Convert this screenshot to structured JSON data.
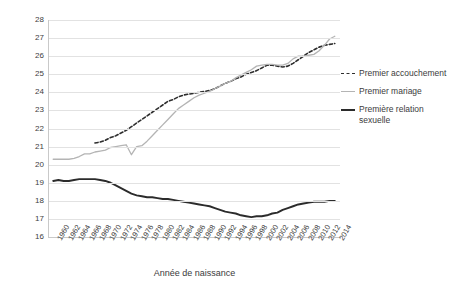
{
  "chart_data": {
    "type": "line",
    "title": "",
    "xlabel": "Année de naissance",
    "ylabel": "",
    "xlim": [
      1959,
      2015
    ],
    "ylim": [
      16,
      28
    ],
    "grid": true,
    "legend_position": "right",
    "x_tick_labels": [
      "1960",
      "1962",
      "1964",
      "1966",
      "1968",
      "1970",
      "1972",
      "1974",
      "1976",
      "1978",
      "1980",
      "1982",
      "1984",
      "1986",
      "1988",
      "1990",
      "1992",
      "1994",
      "1996",
      "1998",
      "2000",
      "2002",
      "2004",
      "2006",
      "2008",
      "2010",
      "2012",
      "2014"
    ],
    "y_tick_labels": [
      "16",
      "17",
      "18",
      "19",
      "20",
      "21",
      "22",
      "23",
      "24",
      "25",
      "26",
      "27",
      "28"
    ],
    "series": [
      {
        "name": "Premier accouchement",
        "style": "dashed",
        "color": "#2e2e2e",
        "x": [
          1968,
          1969,
          1970,
          1971,
          1972,
          1973,
          1974,
          1975,
          1976,
          1977,
          1978,
          1979,
          1980,
          1981,
          1982,
          1983,
          1984,
          1985,
          1986,
          1987,
          1988,
          1989,
          1990,
          1991,
          1992,
          1993,
          1994,
          1995,
          1996,
          1997,
          1998,
          1999,
          2000,
          2001,
          2002,
          2003,
          2004,
          2005,
          2006,
          2007,
          2008,
          2009,
          2010,
          2011,
          2012,
          2013,
          2014
        ],
        "values": [
          21.2,
          21.25,
          21.35,
          21.5,
          21.6,
          21.75,
          21.9,
          22.1,
          22.3,
          22.5,
          22.7,
          22.9,
          23.1,
          23.3,
          23.5,
          23.6,
          23.75,
          23.85,
          23.9,
          23.95,
          24.0,
          24.05,
          24.1,
          24.2,
          24.35,
          24.5,
          24.6,
          24.75,
          24.85,
          25.0,
          25.1,
          25.2,
          25.35,
          25.5,
          25.5,
          25.45,
          25.4,
          25.45,
          25.6,
          25.8,
          26.0,
          26.2,
          26.35,
          26.5,
          26.6,
          26.65,
          26.7
        ]
      },
      {
        "name": "Premier mariage",
        "style": "solid-light",
        "color": "#b4b4b4",
        "x": [
          1960,
          1961,
          1962,
          1963,
          1964,
          1965,
          1966,
          1967,
          1968,
          1969,
          1970,
          1971,
          1972,
          1973,
          1974,
          1975,
          1976,
          1977,
          1978,
          1979,
          1980,
          1981,
          1982,
          1983,
          1984,
          1985,
          1986,
          1987,
          1988,
          1989,
          1990,
          1991,
          1992,
          1993,
          1994,
          1995,
          1996,
          1997,
          1998,
          1999,
          2000,
          2001,
          2002,
          2003,
          2004,
          2005,
          2006,
          2007,
          2008,
          2009,
          2010,
          2011,
          2012,
          2013,
          2014
        ],
        "values": [
          20.3,
          20.3,
          20.3,
          20.3,
          20.35,
          20.45,
          20.6,
          20.6,
          20.7,
          20.75,
          20.8,
          20.95,
          21.0,
          21.05,
          21.1,
          20.55,
          21.0,
          21.05,
          21.3,
          21.6,
          21.9,
          22.2,
          22.5,
          22.8,
          23.1,
          23.3,
          23.5,
          23.7,
          23.85,
          23.95,
          24.05,
          24.2,
          24.35,
          24.5,
          24.6,
          24.8,
          24.95,
          25.1,
          25.25,
          25.45,
          25.5,
          25.55,
          25.55,
          25.5,
          25.5,
          25.6,
          25.85,
          26.0,
          26.0,
          26.05,
          26.1,
          26.3,
          26.6,
          26.95,
          27.1
        ]
      },
      {
        "name": "Première relation sexuelle",
        "style": "solid-bold",
        "color": "#2b2b2b",
        "x": [
          1960,
          1961,
          1962,
          1963,
          1964,
          1965,
          1966,
          1967,
          1968,
          1969,
          1970,
          1971,
          1972,
          1973,
          1974,
          1975,
          1976,
          1977,
          1978,
          1979,
          1980,
          1981,
          1982,
          1983,
          1984,
          1985,
          1986,
          1987,
          1988,
          1989,
          1990,
          1991,
          1992,
          1993,
          1994,
          1995,
          1996,
          1997,
          1998,
          1999,
          2000,
          2001,
          2002,
          2003,
          2004,
          2005,
          2006,
          2007,
          2008,
          2009,
          2010,
          2011,
          2012,
          2013,
          2014
        ],
        "values": [
          19.1,
          19.15,
          19.1,
          19.1,
          19.15,
          19.2,
          19.2,
          19.2,
          19.2,
          19.15,
          19.1,
          19.0,
          18.85,
          18.7,
          18.55,
          18.4,
          18.3,
          18.25,
          18.2,
          18.2,
          18.15,
          18.1,
          18.1,
          18.05,
          18.0,
          17.95,
          17.9,
          17.85,
          17.8,
          17.75,
          17.7,
          17.6,
          17.5,
          17.4,
          17.35,
          17.3,
          17.2,
          17.15,
          17.1,
          17.15,
          17.15,
          17.2,
          17.3,
          17.35,
          17.5,
          17.6,
          17.7,
          17.8,
          17.85,
          17.9,
          17.95,
          17.95,
          17.95,
          18.0,
          18.0
        ]
      }
    ]
  },
  "legend": {
    "entries": [
      {
        "label": "Premier accouchement",
        "swatch": "dashed-line-swatch"
      },
      {
        "label": "Premier mariage",
        "swatch": "light-line-swatch"
      },
      {
        "label": "Première relation sexuelle",
        "swatch": "bold-line-swatch"
      }
    ]
  }
}
